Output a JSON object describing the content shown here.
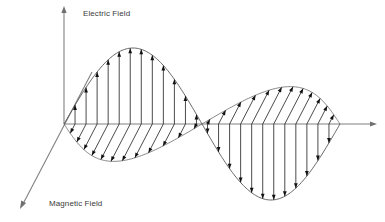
{
  "figure": {
    "type": "diagram",
    "background_color": "#ffffff",
    "width": 385,
    "height": 222
  },
  "labels": {
    "electric_field": "Electric Field",
    "magnetic_field": "Magnetic Field"
  },
  "axes": {
    "electric": {
      "name": "Electric Field",
      "orientation": "vertical",
      "icon": "arrow-up-icon",
      "color": "#808080",
      "x": 64,
      "y_top": 8,
      "y_bottom": 124
    },
    "propagation": {
      "name": "Propagation",
      "orientation": "horizontal",
      "icon": "arrow-right-icon",
      "color": "#808080",
      "y": 124,
      "x_left": 64,
      "x_right": 376
    },
    "magnetic": {
      "name": "Magnetic Field",
      "orientation": "diagonal",
      "icon": "arrow-down-left-icon",
      "color": "#808080",
      "x_start": 92,
      "y_start": 72,
      "x_end": 21,
      "y_end": 207
    }
  },
  "chart_data": {
    "type": "line",
    "title": "",
    "xlabel": "",
    "ylabel": "",
    "grid": false,
    "legend": "none",
    "baseline_y": 124,
    "wavelength_px": 296,
    "series": [
      {
        "name": "Electric Field",
        "label": "Electric Field",
        "plane": "vertical",
        "color": "#2b2b2b",
        "amplitude_px": 76,
        "phase": "sine",
        "arrow_direction_first_half": "up",
        "arrow_direction_second_half": "down",
        "vector_count": 24,
        "x_start": 64,
        "x_zero_crossing": 212,
        "x_end": 340,
        "peak": {
          "x": 130,
          "y": 48
        },
        "trough": {
          "x": 285,
          "y": 180
        }
      },
      {
        "name": "Magnetic Field",
        "label": "Magnetic Field",
        "plane": "diagonal",
        "color": "#2b2b2b",
        "amplitude_px": 42,
        "phase": "sine",
        "arrow_direction_first_half": "down-left",
        "arrow_direction_second_half": "up-right",
        "vector_count": 24,
        "x_start": 64,
        "x_zero_crossing": 212,
        "x_end": 340,
        "lobe_left": {
          "x_min": 50,
          "x_max": 212,
          "y_max": 163
        },
        "lobe_right": {
          "x_min": 212,
          "x_max": 337,
          "y_min": 82
        }
      }
    ]
  }
}
